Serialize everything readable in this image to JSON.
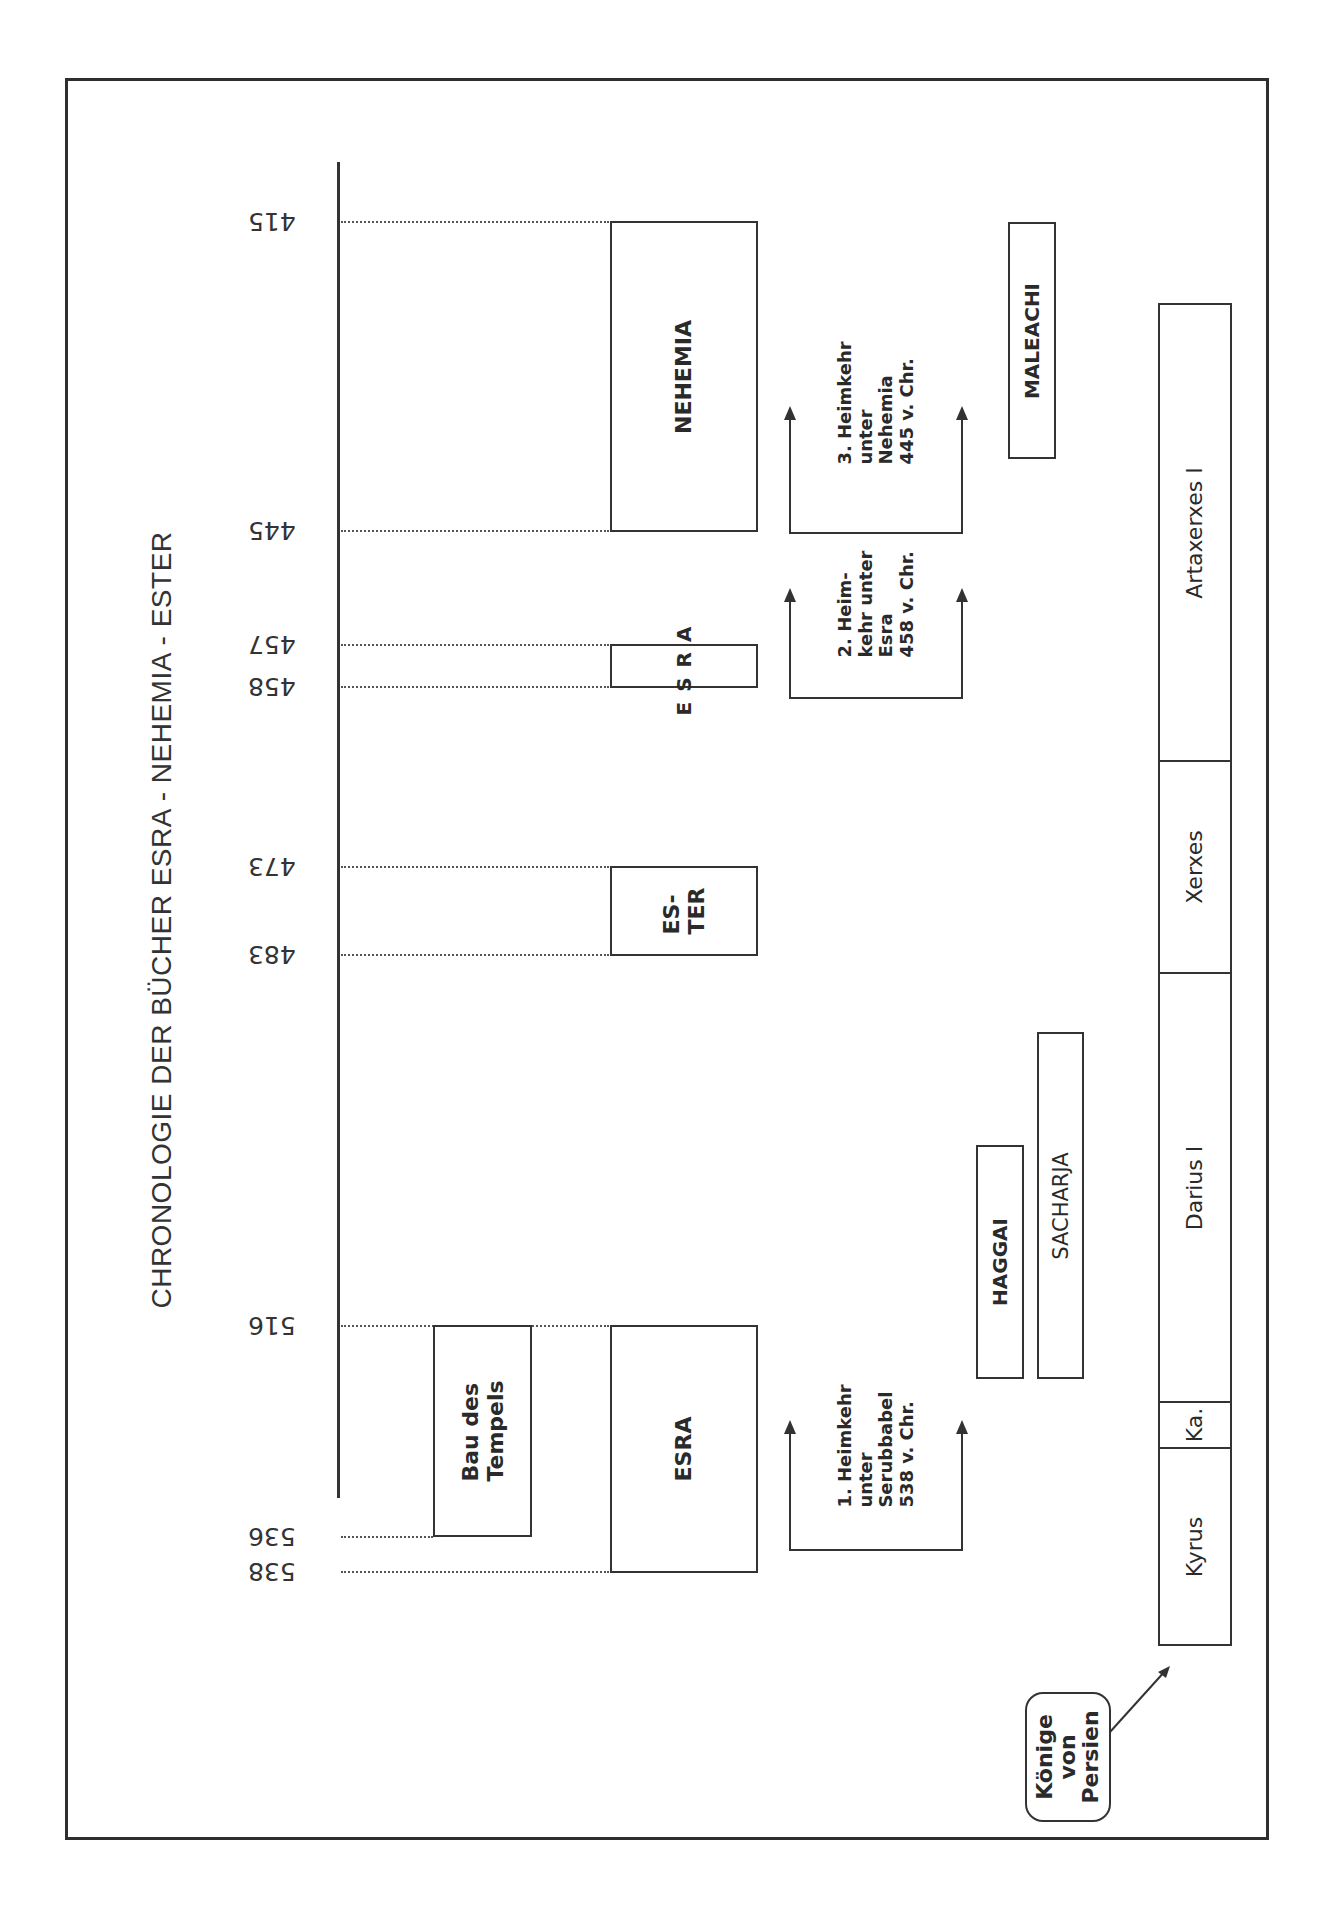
{
  "title": "CHRONOLOGIE DER BÜCHER ESRA - NEHEMIA - ESTER",
  "axis": {
    "years": [
      {
        "label": "415",
        "y": 221
      },
      {
        "label": "445",
        "y": 530
      },
      {
        "label": "457",
        "y": 644
      },
      {
        "label": "458",
        "y": 686
      },
      {
        "label": "473",
        "y": 866
      },
      {
        "label": "483",
        "y": 954
      },
      {
        "label": "516",
        "y": 1325
      },
      {
        "label": "536",
        "y": 1536
      },
      {
        "label": "538",
        "y": 1571
      }
    ]
  },
  "books": {
    "nehemia": "NEHEMIA",
    "esra_late": [
      "E",
      "S",
      "R",
      "A"
    ],
    "ester": [
      "ES-",
      "TER"
    ],
    "esra": "ESRA",
    "bau_des_tempels": [
      "Bau des",
      "Tempels"
    ]
  },
  "prophets": {
    "maleachi": "MALEACHI",
    "haggai": "HAGGAI",
    "sacharja": "SACHARJA"
  },
  "returns": [
    {
      "lines": [
        "1. Heimkehr",
        "unter",
        "Serubbabel",
        "538 v. Chr."
      ]
    },
    {
      "lines": [
        "2. Heim-",
        "kehr unter",
        "Esra",
        "458 v. Chr."
      ]
    },
    {
      "lines": [
        "3. Heimkehr",
        "unter",
        "Nehemia",
        "445 v. Chr."
      ]
    }
  ],
  "kings": {
    "callout": [
      "Könige",
      "von",
      "Persien"
    ],
    "list": [
      {
        "name": "Artaxerxes I"
      },
      {
        "name": "Xerxes"
      },
      {
        "name": "Darius I"
      },
      {
        "name": "Ka."
      },
      {
        "name": "Kyrus"
      }
    ]
  },
  "colors": {
    "line": "#333333",
    "background": "#ffffff"
  }
}
